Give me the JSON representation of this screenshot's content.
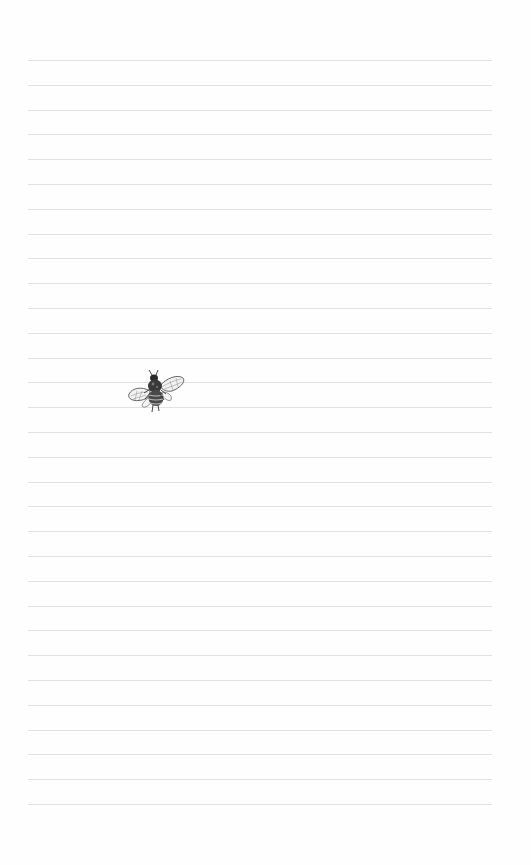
{
  "page": {
    "type": "lined-notebook-page",
    "background_color": "#fefefe",
    "line_color": "#e2e2e2",
    "line_count": 31,
    "first_line_y": 60,
    "line_spacing": 24.8,
    "line_left": 28,
    "line_width": 464
  },
  "decoration": {
    "icon": "bee-icon",
    "description": "vintage engraved bee illustration"
  }
}
